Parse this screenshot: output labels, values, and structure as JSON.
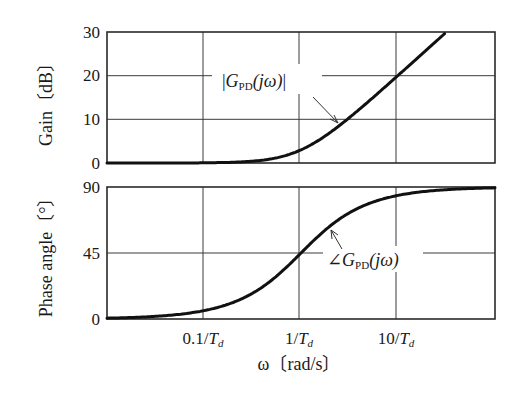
{
  "chart_data": [
    {
      "type": "line",
      "title": "",
      "panel": "gain",
      "xlabel": "ω〔rad/s〕",
      "ylabel": "Gain〔dB〕",
      "xscale": "log",
      "x_unit_note": "ω in units of 1/T_d",
      "xlim": [
        0.01,
        100
      ],
      "ylim": [
        0,
        30
      ],
      "yticks": [
        0,
        10,
        20,
        30
      ],
      "xticks": [
        0.1,
        1,
        10
      ],
      "xtick_labels": [
        "0.1/Td",
        "1/Td",
        "10/Td"
      ],
      "grid": true,
      "series": [
        {
          "name": "|G_PD(jω)|",
          "x": [
            0.01,
            0.03,
            0.1,
            0.3,
            0.5,
            1,
            2,
            3,
            5,
            10,
            20,
            31.6
          ],
          "values": [
            0.0,
            0.0,
            0.04,
            0.37,
            0.97,
            3.01,
            6.99,
            10.0,
            14.15,
            20.04,
            26.03,
            30.0
          ]
        }
      ],
      "annotations": [
        "|G_PD(jω)|"
      ]
    },
    {
      "type": "line",
      "title": "",
      "panel": "phase",
      "xlabel": "ω〔rad/s〕",
      "ylabel": "Phase angle〔°〕",
      "xscale": "log",
      "xlim": [
        0.01,
        100
      ],
      "ylim": [
        0,
        90
      ],
      "yticks": [
        0,
        45,
        90
      ],
      "xticks": [
        0.1,
        1,
        10
      ],
      "xtick_labels": [
        "0.1/Td",
        "1/Td",
        "10/Td"
      ],
      "grid": true,
      "series": [
        {
          "name": "∠G_PD(jω)",
          "x": [
            0.01,
            0.03,
            0.1,
            0.3,
            0.5,
            1,
            2,
            3,
            5,
            10,
            30,
            100
          ],
          "values": [
            0.6,
            1.7,
            5.7,
            16.7,
            26.6,
            45.0,
            63.4,
            71.6,
            78.7,
            84.3,
            88.1,
            89.4
          ]
        }
      ],
      "annotations": [
        "∠G_PD(jω)"
      ]
    }
  ],
  "labels": {
    "gain_ylabel": "Gain〔dB〕",
    "phase_ylabel": "Phase angle〔°〕",
    "xlabel": "ω〔rad/s〕",
    "gain_ticks": [
      "30",
      "20",
      "10",
      "0"
    ],
    "phase_ticks": [
      "90",
      "45",
      "0"
    ],
    "x_ticks": [
      {
        "num": "0.1/",
        "var": "T",
        "sub": "d"
      },
      {
        "num": "1/",
        "var": "T",
        "sub": "d"
      },
      {
        "num": "10/",
        "var": "T",
        "sub": "d"
      }
    ],
    "gain_annotation": {
      "prefix": "|",
      "var": "G",
      "sub": "PD",
      "arg": "(jω)",
      "suffix": "|"
    },
    "phase_annotation": {
      "prefix": "∠",
      "var": "G",
      "sub": "PD",
      "arg": "(jω)"
    }
  }
}
